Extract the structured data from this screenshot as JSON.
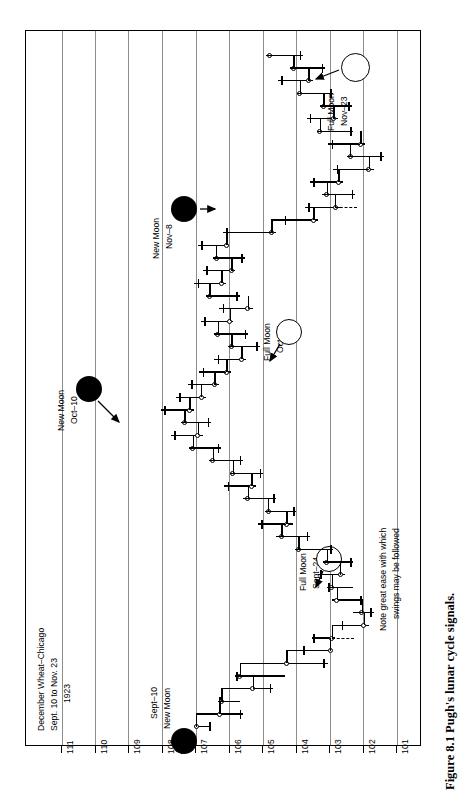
{
  "figure": {
    "caption": "Figure 8.1   Pugh's lunar cycle signals.",
    "note_line1": "Note great ease with which",
    "note_line2": "swings may be followed"
  },
  "chart_data": {
    "type": "bar",
    "title_line1": "December Wheat–Chicago",
    "title_line2": "Sept. 10 to Nov. 23",
    "title_line3": "1923",
    "xlabel": "",
    "ylabel": "",
    "orientation": "rotated-90",
    "price_axis": {
      "tick_labels": [
        "111",
        "110",
        "109",
        "108",
        "107",
        "106",
        "105",
        "104",
        "103",
        "102",
        "101"
      ],
      "values": [
        111,
        110,
        109,
        108,
        107,
        106,
        105,
        104,
        103,
        102,
        101
      ],
      "min": 101,
      "max": 111,
      "grid": true
    },
    "time_axis": {
      "label": "Sept. 10 to Nov. 23, 1923",
      "direction": "bottom-to-top",
      "sessions": 54
    },
    "annotations": [
      {
        "name": "sept-10-new-moon",
        "line1": "Sept–10",
        "line2": "New Moon",
        "moon": "new",
        "date": "Sept 10"
      },
      {
        "name": "sept-24-full-moon",
        "line1": "Full Moon",
        "line2": "Sept–24",
        "moon": "full",
        "date": "Sept 24"
      },
      {
        "name": "oct-10-new-moon",
        "line1": "New Moon",
        "line2": "Oct–10",
        "moon": "new",
        "date": "Oct 10"
      },
      {
        "name": "oct-24-full-moon",
        "line1": "Full Moon",
        "line2": "Oct–24",
        "moon": "full",
        "date": "Oct 24"
      },
      {
        "name": "nov-8-new-moon",
        "line1": "New Moon",
        "line2": "Nov–8",
        "moon": "new",
        "date": "Nov 8"
      },
      {
        "name": "nov-23-full-moon",
        "line1": "Full Moon",
        "line2": "Nov–23",
        "moon": "full",
        "date": "Nov 23"
      }
    ],
    "series_name": "December Wheat – Chicago daily high/low/close",
    "bars": [
      {
        "low": 106.55,
        "high": 107.05,
        "close": 107.0,
        "open": 106.6
      },
      {
        "low": 105.6,
        "high": 106.35,
        "close": 106.3,
        "open": 105.7
      },
      {
        "low": 105.7,
        "high": 106.35,
        "close": 106.25,
        "open": 106.3
      },
      {
        "low": 104.7,
        "high": 105.95,
        "close": 105.3,
        "open": 104.8
      },
      {
        "low": 104.35,
        "high": 105.85,
        "close": 105.7,
        "open": 105.8
      },
      {
        "low": 103.05,
        "high": 104.95,
        "close": 104.3,
        "open": 103.2
      },
      {
        "low": 102.95,
        "high": 103.9,
        "close": 103.0,
        "open": 103.8
      },
      {
        "low": 102.85,
        "high": 103.55,
        "close": 102.95,
        "open": 103.5
      },
      {
        "low": 101.85,
        "high": 102.75,
        "close": 102.0,
        "open": 102.65
      },
      {
        "low": 101.7,
        "high": 102.3,
        "close": 102.05,
        "open": 101.8
      },
      {
        "low": 102.0,
        "high": 102.95,
        "close": 102.8,
        "open": 102.1
      },
      {
        "low": 102.3,
        "high": 103.1,
        "close": 102.95,
        "open": 103.05
      },
      {
        "low": 102.55,
        "high": 103.35,
        "close": 102.7,
        "open": 103.3
      },
      {
        "low": 102.3,
        "high": 103.2,
        "close": 103.1,
        "open": 102.4
      },
      {
        "low": 102.9,
        "high": 104.05,
        "close": 103.95,
        "open": 103.0
      },
      {
        "low": 103.6,
        "high": 104.6,
        "close": 104.45,
        "open": 103.7
      },
      {
        "low": 104.1,
        "high": 105.15,
        "close": 104.3,
        "open": 105.05
      },
      {
        "low": 104.0,
        "high": 104.95,
        "close": 104.85,
        "open": 104.1
      },
      {
        "low": 104.6,
        "high": 105.6,
        "close": 105.45,
        "open": 104.7
      },
      {
        "low": 105.2,
        "high": 106.15,
        "close": 105.35,
        "open": 106.05
      },
      {
        "low": 105.0,
        "high": 106.0,
        "close": 105.9,
        "open": 105.1
      },
      {
        "low": 105.6,
        "high": 106.6,
        "close": 106.5,
        "open": 105.7
      },
      {
        "low": 106.25,
        "high": 107.2,
        "close": 107.1,
        "open": 106.35
      },
      {
        "low": 106.8,
        "high": 107.75,
        "close": 106.95,
        "open": 107.65
      },
      {
        "low": 106.55,
        "high": 107.45,
        "close": 107.35,
        "open": 106.65
      },
      {
        "low": 107.05,
        "high": 108.05,
        "close": 107.2,
        "open": 107.95
      },
      {
        "low": 106.7,
        "high": 107.6,
        "close": 106.85,
        "open": 107.5
      },
      {
        "low": 106.3,
        "high": 107.25,
        "close": 106.45,
        "open": 107.15
      },
      {
        "low": 105.95,
        "high": 106.9,
        "close": 106.1,
        "open": 106.8
      },
      {
        "low": 105.5,
        "high": 106.45,
        "close": 105.65,
        "open": 106.35
      },
      {
        "low": 105.1,
        "high": 106.05,
        "close": 105.95,
        "open": 105.2
      },
      {
        "low": 105.45,
        "high": 106.45,
        "close": 106.35,
        "open": 105.55
      },
      {
        "low": 105.9,
        "high": 106.85,
        "close": 106.0,
        "open": 106.75
      },
      {
        "low": 105.3,
        "high": 106.3,
        "close": 105.45,
        "open": 106.2
      },
      {
        "low": 105.7,
        "high": 106.7,
        "close": 106.6,
        "open": 105.8
      },
      {
        "low": 106.1,
        "high": 107.05,
        "close": 106.25,
        "open": 106.95
      },
      {
        "low": 105.85,
        "high": 106.8,
        "close": 105.95,
        "open": 106.7
      },
      {
        "low": 105.55,
        "high": 106.5,
        "close": 106.4,
        "open": 105.65
      },
      {
        "low": 106.0,
        "high": 106.95,
        "close": 106.1,
        "open": 106.85
      },
      {
        "low": 104.6,
        "high": 106.2,
        "close": 104.75,
        "open": 106.1
      },
      {
        "low": 103.35,
        "high": 104.45,
        "close": 103.5,
        "open": 104.35
      },
      {
        "low": 102.7,
        "high": 103.75,
        "close": 102.85,
        "open": 103.65
      },
      {
        "low": 102.25,
        "high": 103.25,
        "close": 103.1,
        "open": 102.35
      },
      {
        "low": 102.6,
        "high": 103.6,
        "close": 102.75,
        "open": 103.5
      },
      {
        "low": 101.7,
        "high": 102.9,
        "close": 101.85,
        "open": 102.8
      },
      {
        "low": 101.4,
        "high": 102.5,
        "close": 102.4,
        "open": 101.5
      },
      {
        "low": 101.95,
        "high": 103.05,
        "close": 102.1,
        "open": 102.95
      },
      {
        "low": 102.3,
        "high": 103.4,
        "close": 103.3,
        "open": 102.4
      },
      {
        "low": 102.75,
        "high": 103.7,
        "close": 102.9,
        "open": 103.6
      },
      {
        "low": 102.35,
        "high": 103.3,
        "close": 103.2,
        "open": 102.45
      },
      {
        "low": 102.9,
        "high": 104.0,
        "close": 103.9,
        "open": 103.0
      },
      {
        "low": 103.5,
        "high": 104.55,
        "close": 103.65,
        "open": 104.45
      },
      {
        "low": 103.15,
        "high": 104.2,
        "close": 104.1,
        "open": 103.25
      },
      {
        "low": 103.8,
        "high": 104.9,
        "close": 104.8,
        "open": 103.9
      }
    ]
  }
}
